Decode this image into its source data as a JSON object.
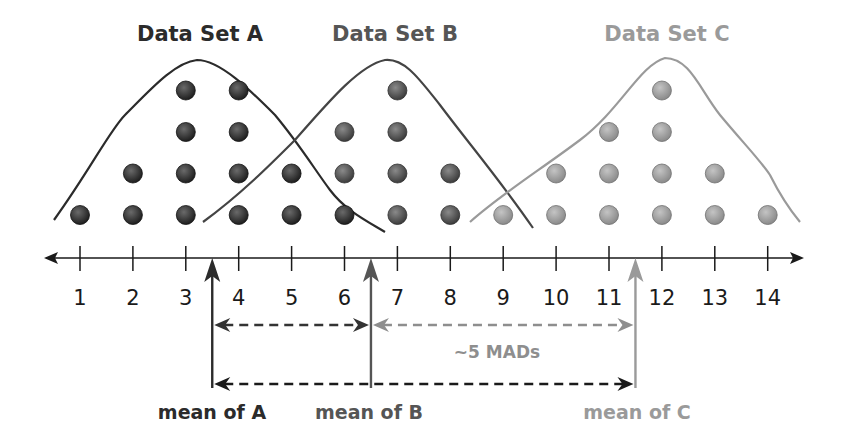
{
  "chart_data": {
    "type": "dot-plot",
    "title": "",
    "xlabel": "",
    "ylabel": "",
    "x_ticks": [
      1,
      2,
      3,
      4,
      5,
      6,
      7,
      8,
      9,
      10,
      11,
      12,
      13,
      14
    ],
    "xlim": [
      0.5,
      14.8
    ],
    "grid": false,
    "series": [
      {
        "name": "Data Set A",
        "color": "#2b2b2b",
        "counts": {
          "1": 1,
          "2": 2,
          "3": 4,
          "4": 4,
          "5": 2,
          "6": 1
        },
        "mean": 3.5,
        "mean_label": "mean of A"
      },
      {
        "name": "Data Set B",
        "color": "#555555",
        "counts": {
          "6": 2,
          "7": 4,
          "8": 2
        },
        "mean": 6.5,
        "mean_label": "mean of B"
      },
      {
        "name": "Data Set C",
        "color": "#9a9a9a",
        "counts": {
          "9": 1,
          "10": 2,
          "11": 3,
          "12": 4,
          "13": 2,
          "14": 1
        },
        "mean": 11.5,
        "mean_label": "mean of C"
      }
    ],
    "annotations": [
      {
        "type": "double-arrow",
        "from": 3.5,
        "to": 6.5,
        "style": "dashed",
        "color": "#333333"
      },
      {
        "type": "double-arrow",
        "from": 6.5,
        "to": 11.5,
        "style": "dashed",
        "color": "#8e8e8e",
        "label": "~5 MADs"
      },
      {
        "type": "double-arrow",
        "from": 3.5,
        "to": 11.5,
        "style": "dashed",
        "color": "#1a1a1a"
      }
    ]
  },
  "labels": {
    "title_a": "Data Set A",
    "title_b": "Data Set B",
    "title_c": "Data Set C",
    "mean_a": "mean of A",
    "mean_b": "mean of B",
    "mean_c": "mean of C",
    "mad": "~5 MADs"
  }
}
